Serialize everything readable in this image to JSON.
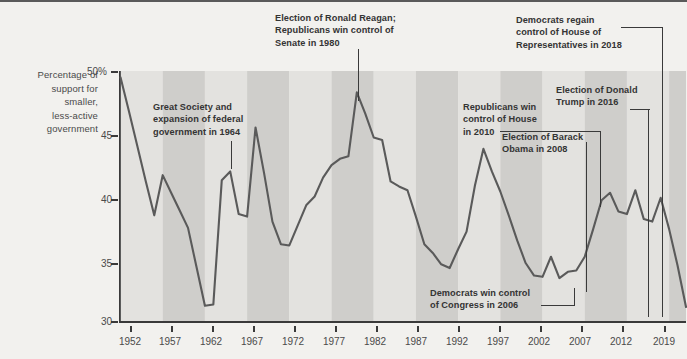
{
  "chart_data": {
    "type": "line",
    "title": "",
    "subtitle": "",
    "xlabel": "",
    "ylabel": "Percentage of support for smaller, less-active government",
    "ylabel_lines": [
      "Percentage of",
      "support for",
      "smaller,",
      "less-active",
      "government"
    ],
    "xlim": [
      1952,
      2019
    ],
    "ylim": [
      30,
      50
    ],
    "grid": false,
    "legend": "none",
    "y_ticks": [
      {
        "value": 50,
        "label": "50%"
      },
      {
        "value": 45,
        "label": "45"
      },
      {
        "value": 40,
        "label": "40"
      },
      {
        "value": 35,
        "label": "35"
      },
      {
        "value": 30,
        "label": "30"
      }
    ],
    "x_ticks": [
      {
        "value": 1952,
        "label": "1952"
      },
      {
        "value": 1957,
        "label": "1957"
      },
      {
        "value": 1962,
        "label": "1962"
      },
      {
        "value": 1967,
        "label": "1967"
      },
      {
        "value": 1972,
        "label": "1972"
      },
      {
        "value": 1977,
        "label": "1977"
      },
      {
        "value": 1982,
        "label": "1982"
      },
      {
        "value": 1987,
        "label": "1987"
      },
      {
        "value": 1992,
        "label": "1992"
      },
      {
        "value": 1997,
        "label": "1997"
      },
      {
        "value": 2002,
        "label": "2002"
      },
      {
        "value": 2007,
        "label": "2007"
      },
      {
        "value": 2012,
        "label": "2012"
      },
      {
        "value": 2019,
        "label": "2019"
      }
    ],
    "series": [
      {
        "name": "Percentage of support for smaller, less-active government",
        "color": "#5a5a5a",
        "x": [
          1952,
          1953,
          1954,
          1955,
          1956,
          1957,
          1958,
          1959,
          1960,
          1961,
          1962,
          1963,
          1964,
          1965,
          1966,
          1967,
          1968,
          1969,
          1970,
          1971,
          1972,
          1973,
          1974,
          1975,
          1976,
          1977,
          1978,
          1979,
          1980,
          1981,
          1982,
          1983,
          1984,
          1985,
          1986,
          1987,
          1988,
          1989,
          1990,
          1991,
          1992,
          1993,
          1994,
          1995,
          1996,
          1997,
          1998,
          1999,
          2000,
          2001,
          2002,
          2003,
          2004,
          2005,
          2006,
          2007,
          2008,
          2009,
          2010,
          2011,
          2012,
          2013,
          2014,
          2015,
          2016,
          2017,
          2018,
          2019
        ],
        "y": [
          49.5,
          46.8,
          44.0,
          41.2,
          38.5,
          41.7,
          40.3,
          38.9,
          37.5,
          34.4,
          31.3,
          31.4,
          41.3,
          42.0,
          38.6,
          38.4,
          45.5,
          41.9,
          38.0,
          36.2,
          36.1,
          37.7,
          39.3,
          40.0,
          41.5,
          42.5,
          43.0,
          43.2,
          48.3,
          46.6,
          44.7,
          44.5,
          41.2,
          40.8,
          40.5,
          38.4,
          36.2,
          35.5,
          34.6,
          34.3,
          35.8,
          37.2,
          40.9,
          43.8,
          42.0,
          40.4,
          38.5,
          36.5,
          34.7,
          33.7,
          33.6,
          35.2,
          33.5,
          34.0,
          34.1,
          35.2,
          37.4,
          39.7,
          40.3,
          38.8,
          38.6,
          40.5,
          38.2,
          38.0,
          39.9,
          37.4,
          34.5,
          31.2
        ]
      }
    ],
    "bands": {
      "description": "alternating vertical shaded bands every 5 years",
      "light": "#e3e2df",
      "dark": "#cfcecb"
    },
    "annotations": [
      {
        "id": "reagan",
        "text": "Election of Ronald Reagan; Republicans win control of Senate in 1980",
        "lines": [
          "Election of Ronald Reagan;",
          "Republicans win control of",
          "Senate in 1980"
        ],
        "year": 1980
      },
      {
        "id": "democrats-2018",
        "text": "Democrats regain control of House of Representatives in 2018",
        "lines": [
          "Democrats regain",
          "control of House of",
          "Representatives in 2018"
        ],
        "year": 2018
      },
      {
        "id": "great-society",
        "text": "Great Society and expansion of federal government in 1964",
        "lines": [
          "Great Society and",
          "expansion of federal",
          "government in 1964"
        ],
        "year": 1964
      },
      {
        "id": "trump-2016",
        "text": "Election of Donald Trump in 2016",
        "lines": [
          "Election of Donald",
          "Trump in 2016"
        ],
        "year": 2016
      },
      {
        "id": "republicans-2010",
        "text": "Republicans win control of House in 2010",
        "lines": [
          "Republicans win",
          "control of House",
          "in 2010"
        ],
        "year": 2010
      },
      {
        "id": "obama-2008",
        "text": "Election of Barack Obama in 2008",
        "lines": [
          "Election of Barack",
          "Obama in 2008"
        ],
        "year": 2008
      },
      {
        "id": "democrats-2006",
        "text": "Democrats win control of Congress in 2006",
        "lines": [
          "Democrats win control",
          "of Congress in 2006"
        ],
        "year": 2006
      }
    ]
  },
  "colors": {
    "line": "#5a5a5a",
    "axis": "#3a3a3a",
    "text": "#4a4a4a",
    "annotation": "#343434",
    "background": "#f2f1ee",
    "band_light": "#e3e2df",
    "band_dark": "#cfcecb"
  }
}
